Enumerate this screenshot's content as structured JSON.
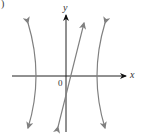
{
  "figure": {
    "part_label": ")",
    "axes": {
      "x_label": "x",
      "y_label": "y",
      "origin_label": "0"
    },
    "curves": [
      {
        "name": "left-hyperbola-branch",
        "description": "vertical-opening branch, vertex on negative x-axis"
      },
      {
        "name": "right-hyperbola-branch",
        "description": "vertical-opening branch, vertex on positive x-axis"
      },
      {
        "name": "slant-asymptote-line",
        "description": "steep line with positive slope crossing y-axis below origin"
      }
    ],
    "colors": {
      "axis": "#222222",
      "curve": "#808080",
      "background": "#ffffff"
    }
  }
}
